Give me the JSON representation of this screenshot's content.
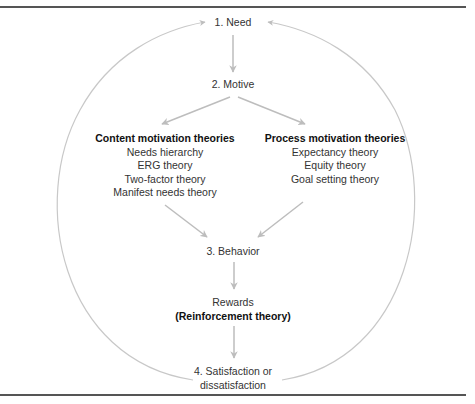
{
  "diagram": {
    "nodes": {
      "need": "1. Need",
      "motive": "2. Motive",
      "behavior": "3. Behavior",
      "rewards": "Rewards",
      "reinforcement": "(Reinforcement theory)",
      "satisfaction_line1": "4. Satisfaction or",
      "satisfaction_line2": "dissatisfaction"
    },
    "content_theories": {
      "title": "Content motivation theories",
      "items": [
        "Needs hierarchy",
        "ERG theory",
        "Two-factor theory",
        "Manifest needs theory"
      ]
    },
    "process_theories": {
      "title": "Process motivation theories",
      "items": [
        "Expectancy theory",
        "Equity theory",
        "Goal setting theory"
      ]
    },
    "colors": {
      "arrow": "#bdbdbd",
      "circle": "#c8c8c8",
      "rule": "#555555",
      "text": "#333333"
    }
  }
}
